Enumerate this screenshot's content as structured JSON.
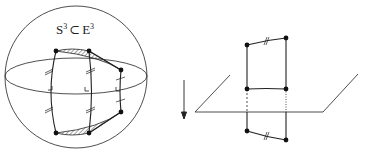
{
  "left_figure": {
    "label_S": "S",
    "label_S_exp": "3",
    "label_subset": "⊂",
    "label_E": "E",
    "label_E_exp": "3",
    "description": "sphere S3 embedded in E3 with a geodesic quadrilateral prism"
  },
  "arrow": {
    "direction": "down"
  },
  "right_figure": {
    "description": "plane with vertical rectangle crossing it; dashed segments below plane"
  },
  "colors": {
    "stroke": "#222222",
    "hatch": "#444444",
    "background": "#ffffff"
  }
}
